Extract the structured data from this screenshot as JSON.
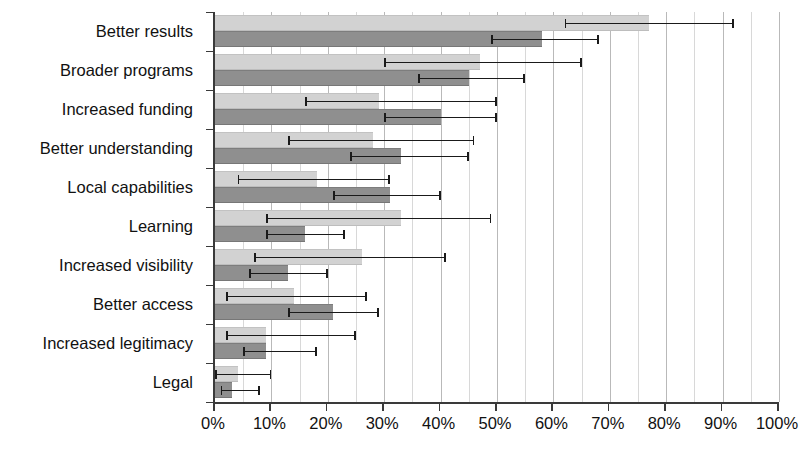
{
  "chart_data": {
    "type": "bar",
    "orientation": "horizontal",
    "title": "",
    "xlabel": "",
    "ylabel": "",
    "xlim": [
      0,
      100
    ],
    "xticks": [
      "0%",
      "10%",
      "20%",
      "30%",
      "40%",
      "50%",
      "60%",
      "70%",
      "80%",
      "90%",
      "100%"
    ],
    "xtick_values": [
      0,
      10,
      20,
      30,
      40,
      50,
      60,
      70,
      80,
      90,
      100
    ],
    "grid": true,
    "grid_interval": 5,
    "legend": [],
    "categories": [
      "Better results",
      "Broader programs",
      "Increased funding",
      "Better understanding",
      "Local capabilities",
      "Learning",
      "Increased visibility",
      "Better access",
      "Increased legitimacy",
      "Legal"
    ],
    "series": [
      {
        "name": "series-light",
        "color": "#d2d2d2",
        "values": [
          77,
          47,
          29,
          28,
          18,
          33,
          26,
          14,
          9,
          4
        ],
        "err_low": [
          62,
          30,
          16,
          13,
          4,
          9,
          7,
          2,
          2,
          0
        ],
        "err_high": [
          92,
          65,
          50,
          46,
          31,
          49,
          41,
          27,
          25,
          10
        ]
      },
      {
        "name": "series-dark",
        "color": "#8f8f8f",
        "values": [
          58,
          45,
          40,
          33,
          31,
          16,
          13,
          21,
          9,
          3
        ],
        "err_low": [
          49,
          36,
          30,
          24,
          21,
          9,
          6,
          13,
          5,
          1
        ],
        "err_high": [
          68,
          55,
          50,
          45,
          40,
          23,
          20,
          29,
          18,
          8
        ]
      }
    ]
  }
}
